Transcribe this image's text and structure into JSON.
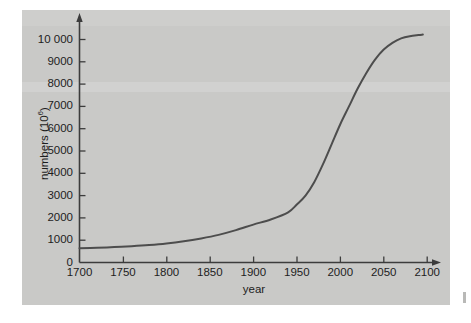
{
  "chart_data": {
    "type": "line",
    "title": "",
    "subtitle": "",
    "xlabel": "year",
    "ylabel": "numbers (10⁶)",
    "ylabel_base": "numbers (10",
    "ylabel_exponent": "6",
    "ylabel_close": ")",
    "xlim": [
      1700,
      2100
    ],
    "ylim": [
      0,
      10600
    ],
    "grid": false,
    "legend": null,
    "x_ticks": [
      1700,
      1750,
      1800,
      1850,
      1900,
      1950,
      2000,
      2050,
      2100
    ],
    "x_tick_labels": [
      "1700",
      "1750",
      "1800",
      "1850",
      "1900",
      "1950",
      "2000",
      "2050",
      "2100"
    ],
    "y_ticks": [
      0,
      1000,
      2000,
      3000,
      4000,
      5000,
      6000,
      7000,
      8000,
      9000,
      10000
    ],
    "y_tick_labels": [
      "0",
      "1000",
      "2000",
      "3000",
      "4000",
      "5000",
      "6000",
      "7000",
      "8000",
      "9000",
      "10 000"
    ],
    "series": [
      {
        "name": "world human population",
        "color": "#4d4d4d",
        "x": [
          1700,
          1720,
          1740,
          1760,
          1780,
          1800,
          1820,
          1840,
          1860,
          1880,
          1900,
          1920,
          1940,
          1950,
          1960,
          1970,
          1980,
          1990,
          2000,
          2010,
          2020,
          2030,
          2040,
          2050,
          2060,
          2070,
          2080,
          2090,
          2095
        ],
        "values": [
          640,
          660,
          690,
          730,
          780,
          850,
          950,
          1080,
          1240,
          1450,
          1700,
          1930,
          2250,
          2600,
          3000,
          3600,
          4400,
          5300,
          6200,
          7000,
          7800,
          8500,
          9100,
          9550,
          9850,
          10050,
          10150,
          10200,
          10220
        ]
      }
    ],
    "annotations": []
  },
  "axes_geometry": {
    "x_axis_label_note": "x axis drawn as arrow extending beyond 2100",
    "y_axis_label_note": "y axis drawn as arrow extending above 10 000"
  }
}
